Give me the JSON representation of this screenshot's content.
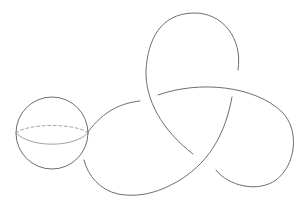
{
  "figure": {
    "colors": {
      "background": "#ffffff",
      "line": "#6e6e6e",
      "equator": "#8a8a8a"
    },
    "sphere": {
      "cx": 52,
      "cy": 133,
      "r": 36
    },
    "knot": {
      "crossings": 3,
      "strands": [
        "M88,132 C104,110 122,103 140,101",
        "M158,95 C200,80 255,86 282,112 C300,130 296,165 276,180 C258,193 228,186 216,170",
        "M238,70 C243,38 222,12 193,13 C160,14 148,40 146,70 C145,100 162,130 193,154",
        "M232,97 C226,130 212,160 180,180 C160,192 140,198 118,194 C100,190 88,176 84,160"
      ]
    }
  }
}
